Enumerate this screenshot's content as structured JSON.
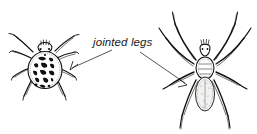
{
  "figure": {
    "title": "jointed legs",
    "background_color": "#ffffff",
    "ink_color": "#111111",
    "label": {
      "text": "jointed legs",
      "style": "italic",
      "x": 93,
      "y": 46
    },
    "annotations": [
      {
        "name": "leader-line-left",
        "from_x": 113,
        "from_y": 51,
        "to_x": 70,
        "to_y": 70,
        "arrow": "left-down"
      },
      {
        "name": "leader-line-right",
        "from_x": 139,
        "from_y": 52,
        "to_x": 187,
        "to_y": 85,
        "arrow": "right-down"
      }
    ],
    "specimens": [
      {
        "name": "mite-spider-left",
        "description": "round dark-blotched spider, eight jointed legs",
        "center_x": 45,
        "center_y": 66,
        "leg_count": 8,
        "abdomen_pattern": "dark blotches"
      },
      {
        "name": "long-legged-spider-right",
        "description": "long-legged spider with pale oval abdomen, eight jointed legs",
        "center_x": 205,
        "center_y": 67,
        "leg_count": 8,
        "abdomen_pattern": "pale stippled"
      }
    ]
  }
}
